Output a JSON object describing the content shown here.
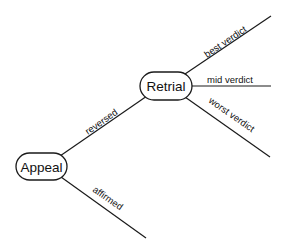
{
  "diagram": {
    "type": "decision-tree",
    "nodes": {
      "appeal": {
        "label": "Appeal"
      },
      "retrial": {
        "label": "Retrial"
      }
    },
    "edges": {
      "reversed": {
        "label": "reversed",
        "from": "Appeal",
        "to": "Retrial"
      },
      "affirmed": {
        "label": "affirmed",
        "from": "Appeal",
        "to": ""
      },
      "best": {
        "label": "best verdict",
        "from": "Retrial",
        "to": ""
      },
      "mid": {
        "label": "mid verdict",
        "from": "Retrial",
        "to": ""
      },
      "worst": {
        "label": "worst verdict",
        "from": "Retrial",
        "to": ""
      }
    },
    "colors": {
      "stroke": "#1a1a1a",
      "background": "#ffffff"
    }
  }
}
